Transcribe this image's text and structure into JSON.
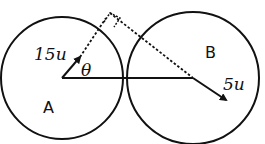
{
  "diagram": {
    "circle_a": {
      "label": "A",
      "velocity_label": "15u"
    },
    "circle_b": {
      "label": "B",
      "velocity_label": "5u"
    },
    "angle_label": "θ",
    "stroke_color": "#111111"
  }
}
